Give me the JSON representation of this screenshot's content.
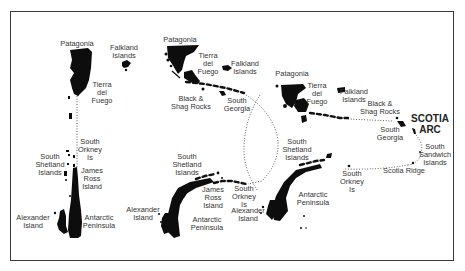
{
  "figure": {
    "frame_color": "#3a3a3a",
    "land_color": "#0d0d0d",
    "panels": [
      {
        "id": "panel-1",
        "labels": {
          "patagonia": "Patagonia",
          "falkland": "Falkland\nIslands",
          "tierra": "Tierra\ndel\nFuego",
          "s_orkney": "South\nOrkney\nIs",
          "s_shetland": "South\nShetland\nIslands",
          "james_ross": "James\nRoss\nIsland",
          "alexander": "Alexander\nIsland",
          "antarctic": "Antarctic\nPeninsula"
        }
      },
      {
        "id": "panel-2",
        "labels": {
          "patagonia": "Patagonia",
          "tierra": "Tierra\ndel\nFuego",
          "falkland": "Falkland\nIslands",
          "black_shag": "Black &\nShag Rocks",
          "s_georgia": "South\nGeorgia",
          "s_shetland": "South\nShetland\nIslands",
          "james_ross": "James\nRoss\nIsland",
          "s_orkney": "South\nOrkney\nIs",
          "alexander": "Alexander\nIsland",
          "antarctic": "Antarctic\nPeninsula"
        }
      },
      {
        "id": "panel-3",
        "labels": {
          "patagonia": "Patagonia",
          "tierra": "Tierra\ndel\nFuego",
          "falkland": "Falkland\nIslands",
          "black_shag": "Black &\nShag Rocks",
          "scotia_arc": "SCOTIA\nARC",
          "s_georgia": "South\nGeorgia",
          "s_shetland": "South\nShetland\nIslands",
          "s_sandwich": "South\nSandwich\nIslands",
          "s_orkney": "South\nOrkney\nIs",
          "scotia_ridge": "Scotia Ridge",
          "alexander": "Alexander\nIsland",
          "antarctic": "Antarctic\nPeninsula"
        }
      }
    ]
  }
}
